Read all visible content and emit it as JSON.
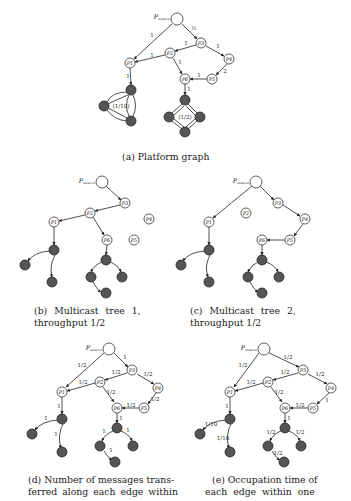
{
  "figure": {
    "subfigures": [
      {
        "id": "a",
        "caption": "(a) Platform graph",
        "source_label": "P_source",
        "nodes": [
          "P_source",
          "P1",
          "P2",
          "P3",
          "P4",
          "P5",
          "P6"
        ],
        "edges": [
          {
            "from": "P_source",
            "to": "P1",
            "label": "1"
          },
          {
            "from": "P_source",
            "to": "P3",
            "label": "1/2"
          },
          {
            "from": "P3",
            "to": "P2",
            "label": "1"
          },
          {
            "from": "P3",
            "to": "P4",
            "label": "1"
          },
          {
            "from": "P2",
            "to": "P1",
            "label": "1"
          },
          {
            "from": "P2",
            "to": "P6",
            "label": "1"
          },
          {
            "from": "P4",
            "to": "P5",
            "label": "2"
          },
          {
            "from": "P5",
            "to": "P6",
            "label": "1"
          },
          {
            "from": "P1",
            "to": "cluster-left",
            "label": "1"
          },
          {
            "from": "P6",
            "to": "cluster-right",
            "label": "1"
          }
        ],
        "cluster_left_label": "(1/10)",
        "cluster_right_label": "(1/2)"
      },
      {
        "id": "b",
        "caption_line1": "(b) Multicast tree 1,",
        "caption_line2": "throughput 1/2"
      },
      {
        "id": "c",
        "caption_line1": "(c) Multicast tree 2,",
        "caption_line2": "throughput 1/2"
      },
      {
        "id": "d",
        "caption_line1": "(d) Number of messages trans-",
        "caption_line2": "ferred along each edge within",
        "edge_labels": {
          "src_p1": "1/2",
          "src_p3": "1",
          "p3_p2": "1/2",
          "p3_p4": "1/2",
          "p2_p1": "1/2",
          "p2_p6": "1/2",
          "p4_p5": "1/2",
          "p5_p6": "1/2",
          "p1_d": "1",
          "d_left": "1",
          "d_bottom": "1",
          "p6_d": "1",
          "d_l": "1",
          "d_r": "1",
          "l_b": "1"
        }
      },
      {
        "id": "e",
        "caption_line1": "(e) Occupation time of",
        "caption_line2": "each edge within one",
        "edge_labels": {
          "src_p1": "1/2",
          "src_p3": "1/2",
          "p3_p2": "1/2",
          "p3_p4": "1/2",
          "p2_p1": "1/2",
          "p2_p6": "1/2",
          "p4_p5": "1",
          "p5_p6": "1/2",
          "p1_d": "1",
          "d_left": "1/10",
          "d_bottom": "1/10",
          "p6_d": "1",
          "d_l": "1/2",
          "d_r": "1/2",
          "l_b": "1/2"
        }
      }
    ],
    "node_labels": {
      "source": "P",
      "source_sub": "source",
      "p1": "P1",
      "p2": "P2",
      "p3": "P3",
      "p4": "P4",
      "p5": "P5",
      "p6": "P6",
      "dark": "P"
    },
    "colors": {
      "white_node": "#ffffff",
      "dark_node": "#555555",
      "edge": "#222222"
    }
  }
}
